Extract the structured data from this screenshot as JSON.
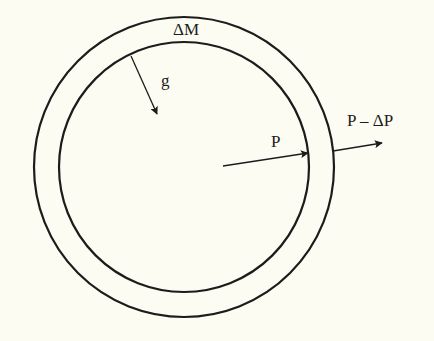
{
  "diagram": {
    "type": "spherical-shell-pressure",
    "background": "#fcfcf2",
    "stroke_color": "#1c1c1c",
    "center": [
      184,
      167
    ],
    "outer_radius": 150,
    "inner_radius": 125,
    "labels": {
      "shell_mass": "ΔM",
      "gravity": "g",
      "inner_pressure": "P",
      "outer_pressure": "P – ΔP"
    },
    "arrows": [
      {
        "name": "gravity",
        "from": [
          131,
          56
        ],
        "to": [
          157,
          114
        ]
      },
      {
        "name": "inner-pressure",
        "from": [
          223,
          166
        ],
        "to": [
          308,
          153
        ]
      },
      {
        "name": "outer-pressure",
        "from": [
          333,
          151
        ],
        "to": [
          382,
          143
        ]
      }
    ]
  }
}
